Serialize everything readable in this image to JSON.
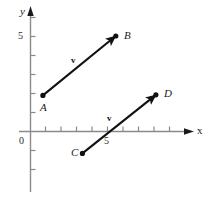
{
  "figure": {
    "background_color": "#ffffff",
    "axis_color": "#7a7a7a",
    "stroke_color": "#111111",
    "width": 208,
    "height": 197
  },
  "axes": {
    "x_label": "x",
    "y_label": "y",
    "origin_label": "0",
    "x_tick_label": "5",
    "y_tick_label": "5",
    "x_ticks": [
      1,
      2,
      3,
      4,
      5,
      6,
      7,
      8,
      9,
      10
    ],
    "y_ticks": [
      1,
      2,
      3,
      4,
      5,
      6
    ],
    "x_negative_ticks": [],
    "y_negative_ticks": [
      -1,
      -2
    ],
    "x_range": [
      -0.1,
      10.4
    ],
    "y_range": [
      -3.2,
      6.6
    ]
  },
  "points": [
    {
      "id": "A",
      "label": "A",
      "x": 0.8,
      "y": 1.9
    },
    {
      "id": "B",
      "label": "B",
      "x": 5.5,
      "y": 5.0
    },
    {
      "id": "C",
      "label": "C",
      "x": 3.35,
      "y": -1.15
    },
    {
      "id": "D",
      "label": "D",
      "x": 8.05,
      "y": 1.9
    }
  ],
  "vectors": [
    {
      "id": "AB",
      "label": "v",
      "from": "A",
      "to": "B"
    },
    {
      "id": "CD",
      "label": "v",
      "from": "C",
      "to": "D"
    }
  ]
}
